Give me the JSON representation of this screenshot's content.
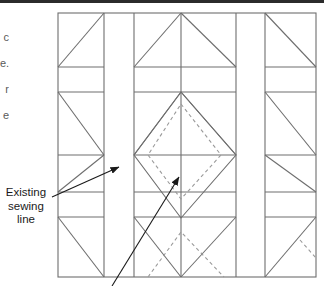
{
  "page": {
    "background_color": "#ffffff",
    "top_rule_color": "#2b2b2b",
    "width": 324,
    "height": 286
  },
  "margin_text": {
    "fragments": [
      "c",
      "e.",
      "r",
      "e"
    ]
  },
  "callout": {
    "line1": "Existing",
    "line2": "sewing",
    "line3": "line",
    "text_color": "#1a1a1a"
  },
  "diagram": {
    "line_color": "#6e6e6e",
    "dashed_line_color": "#9a9a9a",
    "arrow_color": "#1a1a1a",
    "block_bounds": {
      "x": 58,
      "y": 13,
      "width": 259,
      "height": 264
    },
    "vertical_lines_x": [
      58,
      104,
      134,
      181,
      236,
      265,
      316
    ],
    "horizontal_lines_y": [
      13,
      67,
      92,
      155,
      192,
      217,
      277
    ],
    "sashing_strips": [
      {
        "x1": 104,
        "x2": 134
      },
      {
        "x1": 236,
        "x2": 265
      }
    ],
    "center_diamond": {
      "style": "solid",
      "cx": 181,
      "cy": 155,
      "rx": 47,
      "ry": 63
    },
    "inner_diamond": {
      "style": "dashed",
      "cx": 181,
      "cy": 144,
      "rx": 33,
      "ry": 44
    },
    "lower_dashed_chevron": {
      "style": "dashed"
    },
    "arrows": [
      {
        "name": "arrow-to-sewing-line-upper",
        "x1": 53,
        "y1": 196,
        "x2": 121,
        "y2": 166
      },
      {
        "name": "arrow-to-sewing-line-lower",
        "x1": 113,
        "y1": 285,
        "x2": 181,
        "y2": 176
      }
    ]
  }
}
